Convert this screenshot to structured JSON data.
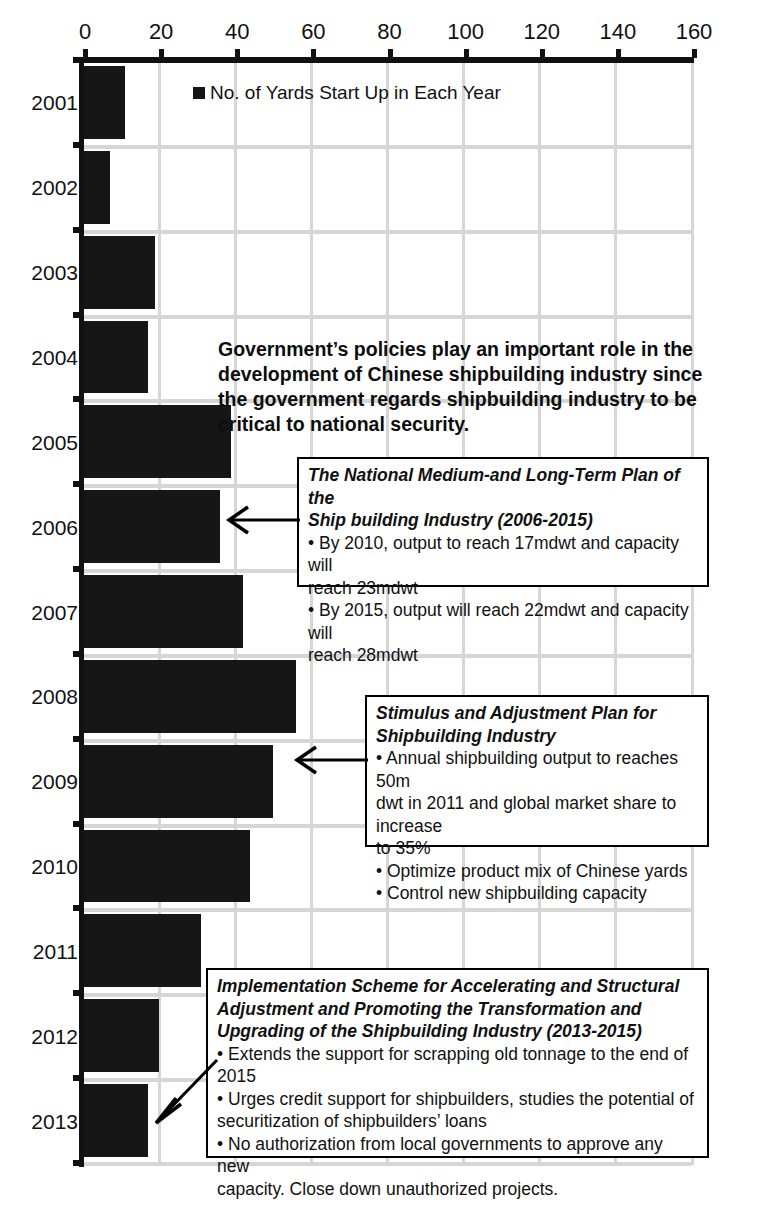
{
  "chart_data": {
    "type": "bar",
    "orientation": "horizontal",
    "title": "",
    "xlabel": "",
    "ylabel": "",
    "xlim": [
      0,
      160
    ],
    "xticks": [
      0,
      20,
      40,
      60,
      80,
      100,
      120,
      140,
      160
    ],
    "grid": true,
    "legend": {
      "position": "top-left-inside",
      "entries": [
        "No. of Yards Start Up in Each Year"
      ]
    },
    "series_name": "No. of Yards Start Up in Each Year",
    "bar_color": "#161616",
    "categories": [
      "2001",
      "2002",
      "2003",
      "2004",
      "2005",
      "2006",
      "2007",
      "2008",
      "2009",
      "2010",
      "2011",
      "2012",
      "2013"
    ],
    "values": [
      11,
      7,
      19,
      17,
      39,
      36,
      42,
      56,
      50,
      44,
      31,
      20,
      17
    ]
  },
  "annotations": {
    "intro": "Government’s policies play an important role in the development of Chinese shipbuilding industry since the government regards shipbuilding industry to be critical to national security.",
    "callouts": [
      {
        "id": "callout-2006",
        "title_lines": [
          "The National Medium-and Long-Term Plan of the",
          "Ship building Industry (2006-2015)"
        ],
        "body_lines": [
          "• By 2010, output to reach 17mdwt and capacity will",
          "reach 23mdwt",
          "• By 2015, output will reach 22mdwt and capacity will",
          "reach 28mdwt"
        ],
        "points_to_year": "2006"
      },
      {
        "id": "callout-2009",
        "title_lines": [
          "Stimulus and Adjustment Plan for",
          "Shipbuilding Industry"
        ],
        "body_lines": [
          "• Annual shipbuilding output to reaches 50m",
          "dwt in 2011 and global market share to increase",
          "to 35%",
          "• Optimize product mix of Chinese yards",
          "• Control new shipbuilding capacity"
        ],
        "points_to_year": "2009"
      },
      {
        "id": "callout-2013",
        "title_lines": [
          "Implementation Scheme for Accelerating and Structural",
          "Adjustment and Promoting the Transformation and",
          "Upgrading of the Shipbuilding Industry (2013-2015)"
        ],
        "body_lines": [
          "• Extends the support for scrapping old tonnage to the end of",
          "2015",
          "• Urges credit support for shipbuilders, studies the potential of",
          "securitization of shipbuilders’ loans",
          "• No authorization from local governments to approve any new",
          "capacity. Close down unauthorized projects."
        ],
        "points_to_year": "2013"
      }
    ]
  },
  "colors": {
    "bar": "#161616",
    "grid": "#d6d6d6",
    "axis": "#111111",
    "background": "#ffffff",
    "text": "#111111"
  }
}
